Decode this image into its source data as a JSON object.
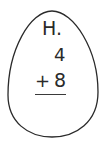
{
  "problem": {
    "label": "H.",
    "addend_top": "4",
    "operator": "+",
    "addend_bottom": "8"
  },
  "colors": {
    "outline": "#2a2a2a",
    "text": "#2a2a2a",
    "background": "#ffffff"
  }
}
